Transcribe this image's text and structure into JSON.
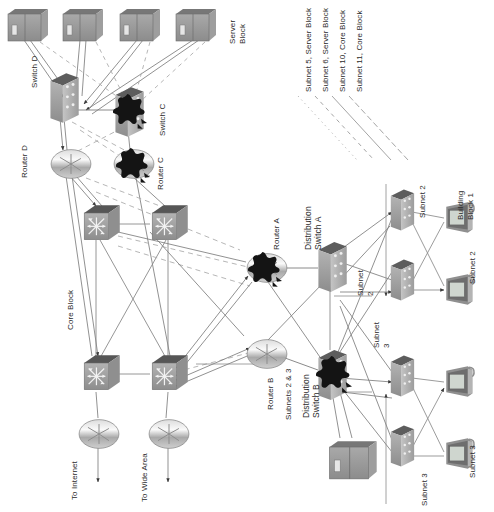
{
  "diagram": {
    "orientation": "rotated-90",
    "colors": {
      "device_fill": "#9a9a9a",
      "device_top": "#6f6f6f",
      "device_side": "#b9b9b9",
      "highlight_blob": "#151515",
      "link": "#777777",
      "dashed_link": "#a8a8a8",
      "text": "#2b2b2b",
      "screen": "#cfd6cf",
      "background": "#ffffff"
    }
  },
  "labels": {
    "server_block": "Server\nBlock",
    "core_block": "Core Block",
    "building_block_1": "Building\nBlock 1",
    "switch_d": "Switch D",
    "switch_c": "Switch C",
    "router_d": "Router D",
    "router_c": "Router C",
    "router_a": "Router A",
    "router_b": "Router B",
    "distribution_switch_a": "Distribution\nSwitch A",
    "distribution_switch_b": "Distribution\nSwitch B",
    "subnets_2_3": "Subnets 2 & 3",
    "subnet_2_dist": "Subnet\n2",
    "subnet_3_dist": "Subnet\n3",
    "subnet_2_top": "Subnet 2",
    "subnet_2_right": "Subnet 2",
    "subnet_3_bottom": "Subnet 3",
    "subnet_3_right": "Subnet 3",
    "to_internet": "To Internet",
    "to_wide_area": "To Wide Area"
  },
  "legend": {
    "entries": [
      {
        "text": "Subnet 5, Server Block",
        "dash": "1 4"
      },
      {
        "text": "Subnet 6, Server Block",
        "dash": "4 4"
      },
      {
        "text": "Subnet 10, Core Block",
        "dash": "0"
      },
      {
        "text": "Subnet 11, Core Block",
        "dash": "6 3"
      }
    ]
  },
  "nodes": {
    "servers_top": [
      {
        "name": "server-1",
        "x": 6,
        "y": 8
      },
      {
        "name": "server-2",
        "x": 60,
        "y": 8
      },
      {
        "name": "server-3",
        "x": 117,
        "y": 8
      },
      {
        "name": "server-4",
        "x": 173,
        "y": 8
      }
    ],
    "server_bottom": {
      "name": "server-5",
      "x": 330,
      "y": 440
    },
    "switches_server_block": [
      {
        "name": "switch-d",
        "x": 47,
        "y": 72,
        "highlight": false
      },
      {
        "name": "switch-c",
        "x": 113,
        "y": 88,
        "highlight": true
      }
    ],
    "routers_server_block": [
      {
        "name": "router-d",
        "x": 58,
        "y": 152,
        "highlight": false
      },
      {
        "name": "router-c",
        "x": 120,
        "y": 152,
        "highlight": true
      }
    ],
    "core_switches": [
      {
        "name": "core-switch-1",
        "x": 82,
        "y": 208
      },
      {
        "name": "core-switch-2",
        "x": 152,
        "y": 208
      },
      {
        "name": "core-switch-3",
        "x": 82,
        "y": 358
      },
      {
        "name": "core-switch-4",
        "x": 152,
        "y": 358
      }
    ],
    "edge_routers": [
      {
        "name": "router-to-internet",
        "x": 88,
        "y": 420
      },
      {
        "name": "router-to-wide-area",
        "x": 158,
        "y": 420
      }
    ],
    "distribution_routers": [
      {
        "name": "router-a",
        "x": 250,
        "y": 255,
        "highlight": true
      },
      {
        "name": "router-b",
        "x": 250,
        "y": 340,
        "highlight": false
      }
    ],
    "distribution_switches": [
      {
        "name": "distribution-switch-a",
        "x": 315,
        "y": 242,
        "highlight": false
      },
      {
        "name": "distribution-switch-b",
        "x": 315,
        "y": 352,
        "highlight": true
      }
    ],
    "access_switches": [
      {
        "name": "access-switch-1",
        "x": 388,
        "y": 192
      },
      {
        "name": "access-switch-2",
        "x": 388,
        "y": 262
      },
      {
        "name": "access-switch-3",
        "x": 388,
        "y": 358
      },
      {
        "name": "access-switch-4",
        "x": 388,
        "y": 428
      }
    ],
    "workstations": [
      {
        "name": "workstation-1",
        "x": 446,
        "y": 208
      },
      {
        "name": "workstation-2",
        "x": 446,
        "y": 278
      },
      {
        "name": "workstation-3",
        "x": 446,
        "y": 372
      },
      {
        "name": "workstation-4",
        "x": 446,
        "y": 442
      }
    ]
  }
}
